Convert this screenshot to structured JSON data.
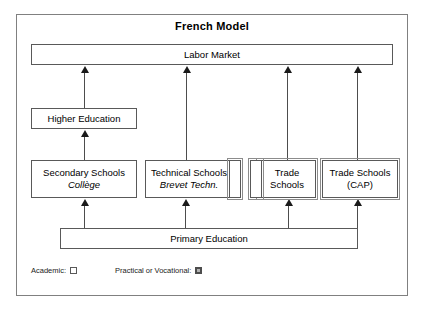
{
  "diagram": {
    "title": "French Model",
    "type": "flowchart",
    "nodes": {
      "labor_market": {
        "label": "Labor Market",
        "category": "academic"
      },
      "higher_education": {
        "label": "Higher Education",
        "category": "academic"
      },
      "secondary_schools": {
        "label": "Secondary Schools",
        "sublabel": "Collège",
        "category": "academic"
      },
      "technical_schools": {
        "label": "Technical Schools",
        "sublabel": "Brevet Techn.",
        "category": "academic"
      },
      "technical_marker": {
        "label": "",
        "category": "vocational"
      },
      "trade_marker": {
        "label": "",
        "category": "vocational"
      },
      "trade_schools": {
        "label": "Trade\nSchools",
        "line1": "Trade",
        "line2": "Schools",
        "category": "vocational"
      },
      "trade_schools_cap": {
        "label": "Trade Schools (CAP)",
        "line1": "Trade Schools",
        "line2": "(CAP)",
        "category": "vocational"
      },
      "primary_education": {
        "label": "Primary Education",
        "category": "academic"
      }
    },
    "edges": [
      {
        "from": "higher_education",
        "to": "labor_market"
      },
      {
        "from": "technical_schools",
        "to": "labor_market"
      },
      {
        "from": "trade_schools",
        "to": "labor_market"
      },
      {
        "from": "trade_schools_cap",
        "to": "labor_market"
      },
      {
        "from": "secondary_schools",
        "to": "higher_education"
      },
      {
        "from": "primary_education",
        "to": "secondary_schools"
      },
      {
        "from": "primary_education",
        "to": "technical_schools"
      },
      {
        "from": "primary_education",
        "to": "trade_schools"
      },
      {
        "from": "primary_education",
        "to": "trade_schools_cap"
      }
    ],
    "legend": {
      "academic": {
        "label": "Academic:",
        "marker": "empty-square"
      },
      "vocational": {
        "label": "Practical or Vocational:",
        "marker": "filled-square"
      }
    },
    "colors": {
      "frame": "#808080",
      "box_border": "#595959",
      "vocational_outline": "#8c8c8c",
      "arrow": "#1a1a1a",
      "text": "#000000",
      "background": "#ffffff"
    }
  }
}
